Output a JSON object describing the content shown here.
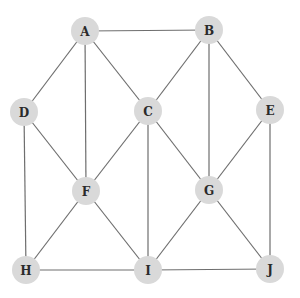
{
  "diagram": {
    "type": "undirected-graph",
    "colors": {
      "node_fill": "#d9d9d9",
      "edge": "#6e6e6e",
      "label": "#2a2a2a",
      "background": "#ffffff"
    },
    "node_radius": 14,
    "nodes": [
      {
        "id": "A",
        "label": "A",
        "x": 85,
        "y": 31
      },
      {
        "id": "B",
        "label": "B",
        "x": 209,
        "y": 30
      },
      {
        "id": "C",
        "label": "C",
        "x": 148,
        "y": 111
      },
      {
        "id": "D",
        "label": "D",
        "x": 24,
        "y": 112
      },
      {
        "id": "E",
        "label": "E",
        "x": 270,
        "y": 110
      },
      {
        "id": "F",
        "label": "F",
        "x": 86,
        "y": 191
      },
      {
        "id": "G",
        "label": "G",
        "x": 209,
        "y": 190
      },
      {
        "id": "H",
        "label": "H",
        "x": 26,
        "y": 270
      },
      {
        "id": "I",
        "label": "I",
        "x": 148,
        "y": 270
      },
      {
        "id": "J",
        "label": "J",
        "x": 270,
        "y": 269
      }
    ],
    "edges": [
      [
        "A",
        "B"
      ],
      [
        "A",
        "D"
      ],
      [
        "A",
        "F"
      ],
      [
        "A",
        "C"
      ],
      [
        "B",
        "C"
      ],
      [
        "B",
        "G"
      ],
      [
        "B",
        "E"
      ],
      [
        "D",
        "F"
      ],
      [
        "D",
        "H"
      ],
      [
        "C",
        "F"
      ],
      [
        "C",
        "I"
      ],
      [
        "C",
        "G"
      ],
      [
        "E",
        "G"
      ],
      [
        "E",
        "J"
      ],
      [
        "F",
        "H"
      ],
      [
        "F",
        "I"
      ],
      [
        "G",
        "I"
      ],
      [
        "G",
        "J"
      ],
      [
        "H",
        "I"
      ],
      [
        "I",
        "J"
      ]
    ]
  }
}
